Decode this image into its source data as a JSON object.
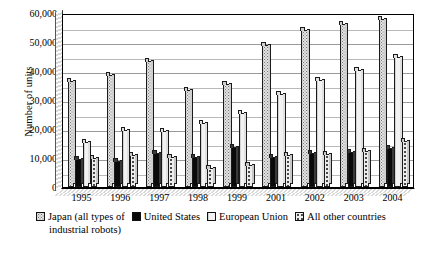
{
  "chart_data": {
    "type": "bar",
    "title": "",
    "xlabel": "",
    "ylabel": "Number of units",
    "ylim": [
      0,
      60000
    ],
    "ytick_step": 10000,
    "gridline_step": 5000,
    "grid": true,
    "legend_position": "bottom",
    "categories": [
      "1995",
      "1996",
      "1997",
      "1998",
      "1999",
      "2001",
      "2002",
      "2003",
      "2004"
    ],
    "ytick_labels": [
      "0",
      "10,000",
      "20,000",
      "30,000",
      "40,000",
      "50,000",
      "60,000"
    ],
    "series": [
      {
        "name": "Japan (all types of industrial robots)",
        "pattern": "dense-dotted",
        "values": [
          36700,
          38600,
          43500,
          33500,
          35600,
          49000,
          54000,
          56300,
          58000
        ]
      },
      {
        "name": "United States",
        "pattern": "solid-black",
        "values": [
          9800,
          8800,
          11800,
          10200,
          13900,
          10500,
          11700,
          12100,
          13600
        ]
      },
      {
        "name": "European Union",
        "pattern": "light-vertical",
        "values": [
          15400,
          19500,
          19400,
          22100,
          25600,
          32100,
          37000,
          40300,
          45000
        ]
      },
      {
        "name": "All other countries",
        "pattern": "coarse-dotted",
        "values": [
          10000,
          11200,
          10400,
          6500,
          7500,
          11000,
          11500,
          12300,
          16000
        ]
      }
    ]
  },
  "legend": {
    "items": [
      {
        "label": "Japan (all types of",
        "swatch": "japan-swatch"
      },
      {
        "label": "United States",
        "swatch": "united-states-swatch"
      },
      {
        "label": "European Union",
        "swatch": "european-union-swatch"
      },
      {
        "label": "All other countries",
        "swatch": "all-other-countries-swatch"
      }
    ],
    "continuation": "industrial robots)"
  }
}
